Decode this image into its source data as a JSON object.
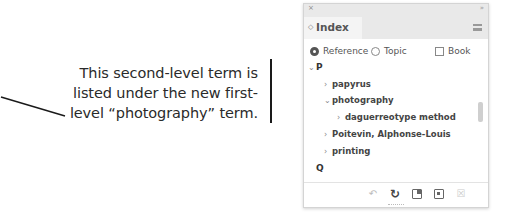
{
  "caption": {
    "lines": [
      "This second-level term is",
      "listed under the new first-",
      "level “photography” term."
    ]
  },
  "panel": {
    "close_glyph": "×",
    "collapse_glyph": "»",
    "tab": {
      "grip_glyph": "◇",
      "label": "Index"
    },
    "menu_icon": "panel-menu-icon",
    "options": {
      "reference": {
        "label": "Reference",
        "selected": true
      },
      "topic": {
        "label": "Topic",
        "selected": false
      },
      "book": {
        "label": "Book",
        "checked": false
      }
    },
    "tree": [
      {
        "level": 0,
        "chevron": "⌄",
        "label": "P",
        "type": "letter"
      },
      {
        "level": 1,
        "chevron": "›",
        "label": "papyrus"
      },
      {
        "level": 1,
        "chevron": "⌄",
        "label": "photography"
      },
      {
        "level": 2,
        "chevron": "›",
        "label": "daguerreotype method"
      },
      {
        "level": 1,
        "chevron": "›",
        "label": "Poitevin, Alphonse-Louis"
      },
      {
        "level": 1,
        "chevron": "›",
        "label": "printing"
      },
      {
        "level": 0,
        "chevron": "",
        "label": "Q",
        "type": "letter"
      }
    ],
    "footer_icons": [
      {
        "name": "go-to-selected-marker-icon",
        "glyph": "↶",
        "enabled": false
      },
      {
        "name": "update-preview-icon",
        "glyph": "↻",
        "enabled": true
      },
      {
        "name": "generate-index-icon",
        "glyph": "",
        "enabled": true
      },
      {
        "name": "create-new-index-entry-icon",
        "glyph": "",
        "enabled": true
      },
      {
        "name": "delete-entry-icon",
        "glyph": "☒",
        "enabled": false
      }
    ]
  }
}
